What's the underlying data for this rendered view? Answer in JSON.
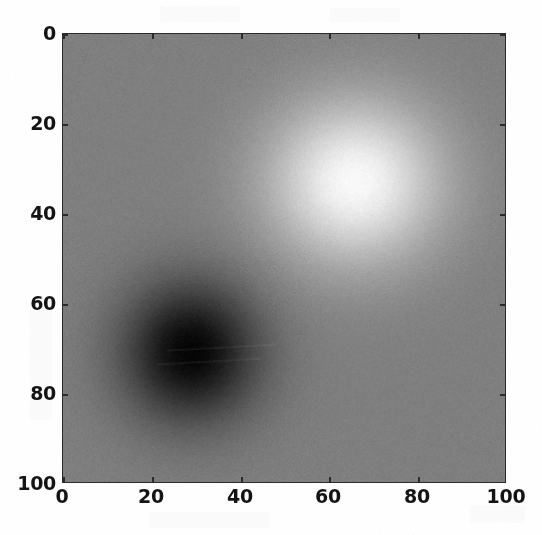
{
  "figure": {
    "kind": "matplotlib-imshow-grayscale",
    "page_background": "#fefefe",
    "axes_facecolor": "#8b8b8b",
    "axes_edgecolor": "#2b2b2b",
    "tick_color": "#2b2b2b",
    "ticklabel_color": "#141414"
  },
  "chart_data": {
    "type": "heatmap",
    "title": "",
    "xlabel": "",
    "ylabel": "",
    "colormap": "gray",
    "origin": "upper",
    "grid": false,
    "legend": null,
    "colorbar": false,
    "xlim": [
      0,
      100
    ],
    "ylim": [
      100,
      0
    ],
    "xticks": [
      0,
      20,
      40,
      60,
      80,
      100
    ],
    "yticks": [
      0,
      20,
      40,
      60,
      80,
      100
    ],
    "xticklabels": [
      "0",
      "20",
      "40",
      "60",
      "80",
      "100"
    ],
    "yticklabels": [
      "0",
      "20",
      "40",
      "60",
      "80",
      "100"
    ],
    "grid_shape": [
      100,
      100
    ],
    "value_range": [
      -1.0,
      1.0
    ],
    "background_value": 0.0,
    "noise_sigma": 0.045,
    "components": [
      {
        "name": "negative-gaussian-blob",
        "center_x": 29,
        "center_y": 71,
        "amplitude": -1.0,
        "sigma_x": 11,
        "sigma_y": 11,
        "rendered_shade": "#000000"
      },
      {
        "name": "positive-gaussian-blob",
        "center_x": 66,
        "center_y": 33,
        "amplitude": 1.0,
        "sigma_x": 14,
        "sigma_y": 13,
        "rendered_shade": "#ffffff"
      }
    ],
    "annotations": []
  },
  "axes_geometry": {
    "left_px": 62,
    "top_px": 33,
    "width_px": 444,
    "height_px": 450
  },
  "ticks": {
    "x": [
      {
        "value": 0,
        "label": "0",
        "px": 62
      },
      {
        "value": 20,
        "label": "20",
        "px": 151
      },
      {
        "value": 40,
        "label": "40",
        "px": 240
      },
      {
        "value": 60,
        "label": "60",
        "px": 328
      },
      {
        "value": 80,
        "label": "80",
        "px": 417
      },
      {
        "value": 100,
        "label": "100",
        "px": 506
      }
    ],
    "y": [
      {
        "value": 0,
        "label": "0",
        "px": 33
      },
      {
        "value": 20,
        "label": "20",
        "px": 123
      },
      {
        "value": 40,
        "label": "40",
        "px": 213
      },
      {
        "value": 60,
        "label": "60",
        "px": 303
      },
      {
        "value": 80,
        "label": "80",
        "px": 393
      },
      {
        "value": 100,
        "label": "100",
        "px": 483
      }
    ]
  }
}
